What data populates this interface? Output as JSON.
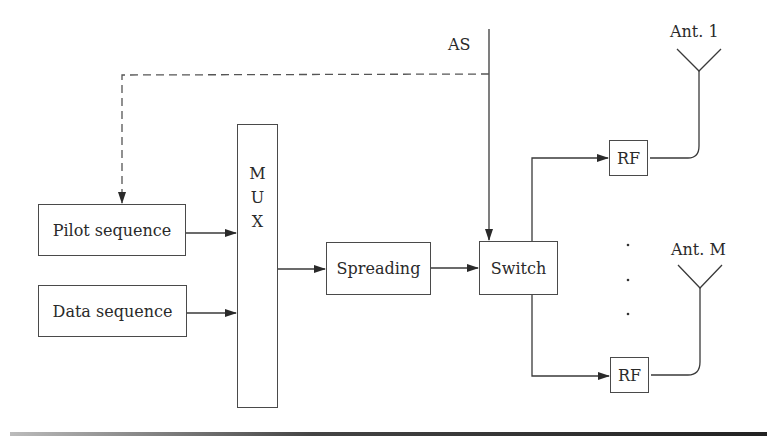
{
  "diagram": {
    "type": "block-diagram",
    "blocks": {
      "pilot": "Pilot sequence",
      "data": "Data sequence",
      "mux": [
        "M",
        "U",
        "X"
      ],
      "spreading": "Spreading",
      "switch": "Switch",
      "rf1": "RF",
      "rfM": "RF"
    },
    "labels": {
      "as": "AS",
      "ant1": "Ant. 1",
      "antM": "Ant. M"
    },
    "connections": [
      {
        "from": "Pilot sequence",
        "to": "MUX"
      },
      {
        "from": "Data sequence",
        "to": "MUX"
      },
      {
        "from": "MUX",
        "to": "Spreading"
      },
      {
        "from": "Spreading",
        "to": "Switch"
      },
      {
        "from": "AS",
        "to": "Switch"
      },
      {
        "from": "AS",
        "to": "Pilot sequence",
        "style": "dashed"
      },
      {
        "from": "Switch",
        "to": "RF (Ant. 1)"
      },
      {
        "from": "Switch",
        "to": "RF (Ant. M)"
      },
      {
        "from": "RF (Ant. 1)",
        "to": "Ant. 1"
      },
      {
        "from": "RF (Ant. M)",
        "to": "Ant. M"
      }
    ],
    "colors": {
      "line": "#3a3a3a",
      "text": "#2a2a2a",
      "background": "#ffffff"
    }
  }
}
